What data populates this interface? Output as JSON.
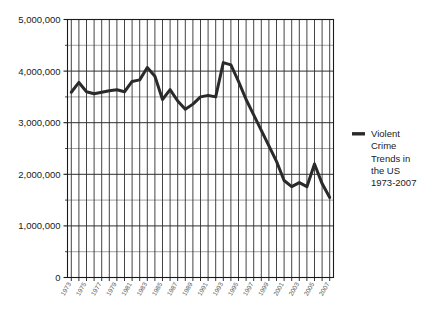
{
  "chart_data": {
    "type": "line",
    "title": "",
    "xlabel": "",
    "ylabel": "",
    "grid": true,
    "legend_position": "right",
    "ylim": [
      0,
      5000000
    ],
    "xlim": [
      1973,
      2007
    ],
    "y_ticks": [
      "0",
      "1,000,000",
      "2,000,000",
      "3,000,000",
      "4,000,000",
      "5,000,000"
    ],
    "y_tick_values": [
      0,
      1000000,
      2000000,
      3000000,
      4000000,
      5000000
    ],
    "y_minor_step": 500000,
    "x_tick_labels": [
      "1973",
      "1975",
      "1977",
      "1979",
      "1981",
      "1983",
      "1985",
      "1987",
      "1989",
      "1991",
      "1993",
      "1995",
      "1997",
      "1999",
      "2001",
      "2003",
      "2005",
      "2007"
    ],
    "x_all_years": [
      1973,
      1974,
      1975,
      1976,
      1977,
      1978,
      1979,
      1980,
      1981,
      1982,
      1983,
      1984,
      1985,
      1986,
      1987,
      1988,
      1989,
      1990,
      1991,
      1992,
      1993,
      1994,
      1995,
      1996,
      1997,
      1998,
      1999,
      2000,
      2001,
      2002,
      2003,
      2004,
      2005,
      2006,
      2007
    ],
    "series": [
      {
        "name": "Violent Crime Trends in the US 1973-2007",
        "color": "#2a2a2a",
        "x": [
          1973,
          1974,
          1975,
          1976,
          1977,
          1978,
          1979,
          1980,
          1981,
          1982,
          1983,
          1984,
          1985,
          1986,
          1987,
          1988,
          1989,
          1990,
          1991,
          1992,
          1993,
          1994,
          1995,
          1996,
          1997,
          1998,
          1999,
          2000,
          2001,
          2002,
          2003,
          2004,
          2005,
          2006,
          2007
        ],
        "values": [
          3590000,
          3780000,
          3600000,
          3560000,
          3590000,
          3620000,
          3640000,
          3600000,
          3800000,
          3830000,
          4070000,
          3900000,
          3450000,
          3640000,
          3420000,
          3260000,
          3360000,
          3500000,
          3530000,
          3500000,
          4165000,
          4120000,
          3800000,
          3450000,
          3150000,
          2850000,
          2550000,
          2250000,
          1880000,
          1760000,
          1840000,
          1760000,
          2200000,
          1820000,
          1550000
        ]
      }
    ],
    "legend_entries": [
      {
        "label_lines": [
          "Violent",
          "Crime",
          "Trends in",
          "the US",
          "1973-2007"
        ],
        "color": "#2a2a2a",
        "marker": "line-swatch"
      }
    ]
  },
  "colors": {
    "line": "#2a2a2a",
    "axis": "#1a1a1a",
    "grid_major": "#2f2f2f",
    "grid_minor": "#7a7a7a",
    "background": "#ffffff",
    "tick_label": "#555555"
  }
}
